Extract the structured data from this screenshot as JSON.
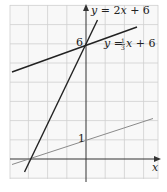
{
  "graph": {
    "axes": {
      "x_label": "x",
      "y_label": "y",
      "origin_px": [
        86,
        159
      ],
      "unit_px": 19.2
    },
    "tick_labels": {
      "y6": "6",
      "y1": "1"
    },
    "lines": [
      {
        "name": "steep-line",
        "equation_label_prefix": "y = 2x + 6",
        "slope": 2,
        "intercept": 6,
        "color": "#222222"
      },
      {
        "name": "shallow-line",
        "equation_label_prefix": "y = ",
        "frac_num": "1",
        "frac_den": "3",
        "equation_label_suffix": "x + 6",
        "slope": 0.3333,
        "intercept": 6,
        "color": "#222222"
      },
      {
        "name": "gray-line",
        "slope": 0.3333,
        "intercept": 1,
        "color": "#777777"
      }
    ],
    "grid_color": "#cccccc",
    "background": "#f7f7f7"
  }
}
